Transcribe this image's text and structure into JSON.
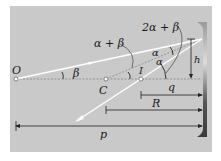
{
  "diagram": {
    "labels": {
      "object": "O",
      "center": "C",
      "image": "I",
      "beta": "β",
      "alpha_top": "α",
      "alpha_bottom": "α",
      "alpha_plus_beta": "α + β",
      "two_alpha_plus_beta": "2α + β",
      "height": "h",
      "image_distance": "q",
      "radius": "R",
      "object_distance": "p"
    },
    "colors": {
      "panel": "#c8c8c8",
      "ray": "#ffffff",
      "axis": "#8a8a8a",
      "dimension": "#1a1a1a"
    }
  }
}
